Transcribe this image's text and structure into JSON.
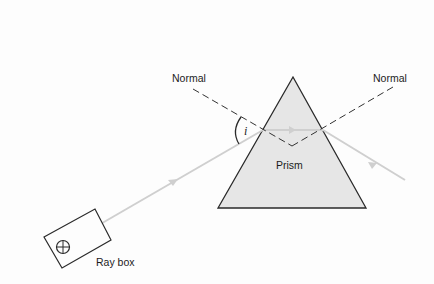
{
  "diagram": {
    "labels": {
      "normal_left": "Normal",
      "normal_right": "Normal",
      "angle": "i",
      "prism": "Prism",
      "ray_box": "Ray box"
    },
    "colors": {
      "background": "#fdfdfd",
      "prism_fill": "#e6e6e6",
      "outline": "#2a2a2a",
      "ray": "#cfcfcf",
      "normal": "#333333"
    },
    "nodes": [
      {
        "id": "ray_box",
        "label": "Ray box"
      },
      {
        "id": "prism",
        "label": "Prism"
      },
      {
        "id": "normal_left",
        "label": "Normal"
      },
      {
        "id": "normal_right",
        "label": "Normal"
      },
      {
        "id": "angle_i",
        "label": "i"
      }
    ]
  }
}
